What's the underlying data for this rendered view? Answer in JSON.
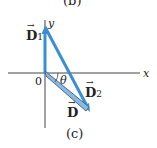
{
  "figure": {
    "prev_caption": "(b)",
    "caption": "(c)",
    "axes": {
      "x_label": "x",
      "y_label": "y",
      "origin_label": "0"
    },
    "angle_label": "θ",
    "vectors": [
      {
        "name": "D",
        "subscript": "1",
        "from": [
          0,
          0
        ],
        "to": [
          0,
          46
        ],
        "color": "#3a8fd4"
      },
      {
        "name": "D",
        "subscript": "2",
        "from": [
          0,
          46
        ],
        "to": [
          45,
          -39
        ],
        "color": "#3a8fd4"
      },
      {
        "name": "D",
        "subscript": "",
        "from": [
          0,
          0
        ],
        "to": [
          45,
          -39
        ],
        "color": "#6aa6d8"
      }
    ]
  }
}
